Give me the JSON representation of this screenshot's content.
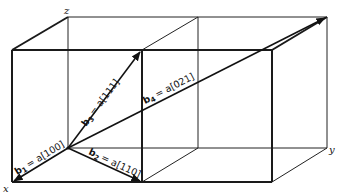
{
  "figure": {
    "type": "crystal lattice diagram",
    "axes": {
      "x": "x",
      "y": "y",
      "z": "z"
    },
    "vectors": [
      {
        "name": "b1",
        "sub": "1",
        "rhs": "= a[100]"
      },
      {
        "name": "b2",
        "sub": "2",
        "rhs": "= a[110]"
      },
      {
        "name": "b3",
        "sub": "3",
        "rhs": "= a[111]"
      },
      {
        "name": "b4",
        "sub": "4",
        "rhs": "= a[021]"
      }
    ],
    "colors": {
      "lines": "#1a1a1a",
      "background": "#ffffff"
    }
  }
}
